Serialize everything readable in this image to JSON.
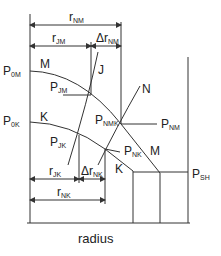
{
  "diagram": {
    "x_axis_label": "radius",
    "curve_labels": {
      "M_top": "M",
      "K_left": "K",
      "J": "J",
      "N": "N",
      "M_right": "M",
      "K_right": "K"
    },
    "pressure_labels": {
      "P0M": {
        "main": "P",
        "sub": "0M"
      },
      "P0K": {
        "main": "P",
        "sub": "0K"
      },
      "PJM": {
        "main": "P",
        "sub": "JM"
      },
      "PJK": {
        "main": "P",
        "sub": "JK"
      },
      "PNMK": {
        "main": "P",
        "sub": "NMK"
      },
      "PNM": {
        "main": "P",
        "sub": "NM"
      },
      "PNK": {
        "main": "P",
        "sub": "NK"
      },
      "PSH": {
        "main": "P",
        "sub": "SH"
      }
    },
    "dimension_labels": {
      "rNM": {
        "main": "r",
        "sub": "NM"
      },
      "rJM": {
        "main": "r",
        "sub": "JM"
      },
      "drNM": {
        "main": "Δr",
        "sub": "NM"
      },
      "rJK": {
        "main": "r",
        "sub": "JK"
      },
      "drNK": {
        "main": "Δr",
        "sub": "NK"
      },
      "rNK": {
        "main": "r",
        "sub": "NK"
      }
    },
    "colors": {
      "line": "#333333",
      "text": "#222222",
      "background": "#ffffff"
    }
  }
}
